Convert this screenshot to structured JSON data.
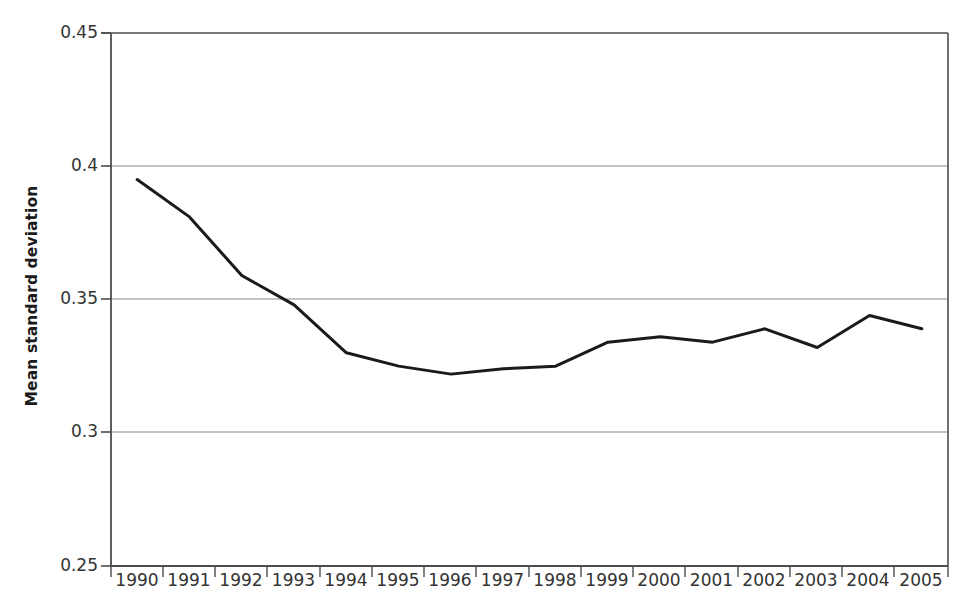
{
  "chart_data": {
    "type": "line",
    "title": "",
    "xlabel": "",
    "ylabel": "Mean standard deviation",
    "categories": [
      "1990",
      "1991",
      "1992",
      "1993",
      "1994",
      "1995",
      "1996",
      "1997",
      "1998",
      "1999",
      "2000",
      "2001",
      "2002",
      "2003",
      "2004",
      "2005"
    ],
    "x": [
      1990,
      1991,
      1992,
      1993,
      1994,
      1995,
      1996,
      1997,
      1998,
      1999,
      2000,
      2001,
      2002,
      2003,
      2004,
      2005
    ],
    "values": [
      0.395,
      0.381,
      0.359,
      0.348,
      0.33,
      0.325,
      0.322,
      0.324,
      0.325,
      0.334,
      0.336,
      0.334,
      0.339,
      0.332,
      0.344,
      0.339
    ],
    "series": [
      {
        "name": "Mean standard deviation",
        "values": [
          0.395,
          0.381,
          0.359,
          0.348,
          0.33,
          0.325,
          0.322,
          0.324,
          0.325,
          0.334,
          0.336,
          0.334,
          0.339,
          0.332,
          0.344,
          0.339
        ],
        "color": "#1a1a1a"
      }
    ],
    "ylim": [
      0.25,
      0.45
    ],
    "yticks": [
      0.25,
      0.3,
      0.35,
      0.4,
      0.45
    ],
    "ytick_labels": [
      "0.25",
      "0.3",
      "0.35",
      "0.4",
      "0.45"
    ],
    "xtick_labels": [
      "1990",
      "1991",
      "1992",
      "1993",
      "1994",
      "1995",
      "1996",
      "1997",
      "1998",
      "1999",
      "2000",
      "2001",
      "2002",
      "2003",
      "2004",
      "2005"
    ],
    "grid": true,
    "grid_axis": "y",
    "grid_color": "#808080",
    "legend": false,
    "legend_position": "none",
    "line_color": "#1a1a1a",
    "line_width": 3,
    "axis_color": "#4d4d4d",
    "background_color": "#ffffff"
  },
  "axis": {
    "y_title": "Mean standard deviation",
    "y_labels": [
      "0.45",
      "0.4",
      "0.35",
      "0.3",
      "0.25"
    ],
    "x_labels": [
      "1990",
      "1991",
      "1992",
      "1993",
      "1994",
      "1995",
      "1996",
      "1997",
      "1998",
      "1999",
      "2000",
      "2001",
      "2002",
      "2003",
      "2004",
      "2005"
    ]
  }
}
